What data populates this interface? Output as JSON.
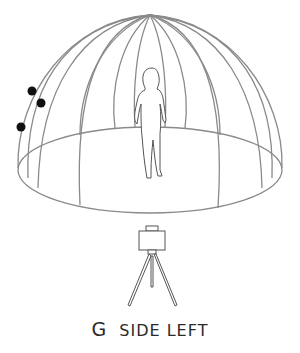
{
  "diagram": {
    "caption": {
      "letter": "G",
      "label": "SIDE LEFT"
    },
    "colors": {
      "background": "#ffffff",
      "line": "#8a8a8a",
      "figure": "#555555",
      "marker": "#111111",
      "text": "#2a2a2a"
    },
    "elements": {
      "dome": "geodesic-style dome with meridian ribs converging at apex",
      "floor": "elliptical floor base of dome",
      "figure": "standing human silhouette in center",
      "camera": "camera on tripod in front of dome",
      "markers": 3
    }
  }
}
